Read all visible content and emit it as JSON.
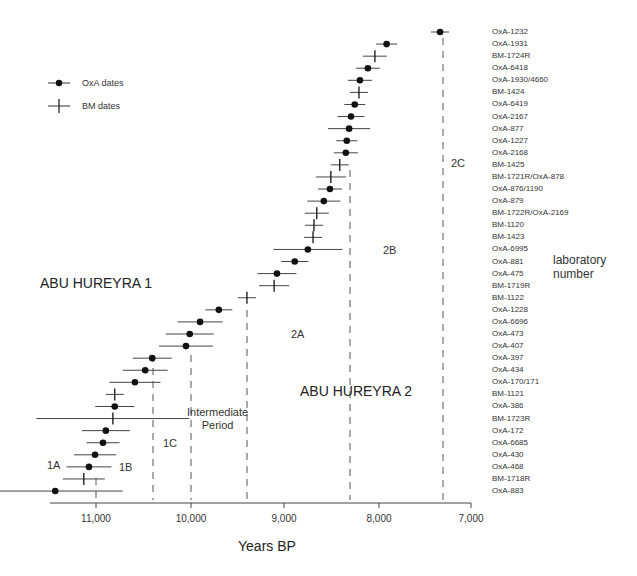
{
  "chart_data": {
    "type": "scatter",
    "title": "",
    "xlabel": "Years BP",
    "ylabel": "laboratory number",
    "x_reversed": true,
    "xlim": [
      11600,
      7000
    ],
    "xticks": [
      11000,
      10000,
      9000,
      8000,
      7000
    ],
    "xtick_labels": [
      "11,000",
      "10,000",
      "9,000",
      "8,000",
      "7,000"
    ],
    "grid": false,
    "legend": {
      "position": "upper-left",
      "entries": [
        {
          "label": "OxA dates",
          "marker": "dot-with-errorbar"
        },
        {
          "label": "BM dates",
          "marker": "cross-with-errorbar"
        }
      ]
    },
    "series": [
      {
        "lab": "OxA-1232",
        "type": "OxA",
        "bp": 7330,
        "err": 60
      },
      {
        "lab": "OxA-1931",
        "type": "OxA",
        "bp": 7900,
        "err": 70
      },
      {
        "lab": "BM-1724R",
        "type": "BM",
        "bp": 8025,
        "err": 80
      },
      {
        "lab": "OxA-6418",
        "type": "OxA",
        "bp": 8100,
        "err": 80
      },
      {
        "lab": "OxA-1930/4660",
        "type": "OxA",
        "bp": 8185,
        "err": 80
      },
      {
        "lab": "BM-1424",
        "type": "BM",
        "bp": 8195,
        "err": 60
      },
      {
        "lab": "OxA-6419",
        "type": "OxA",
        "bp": 8240,
        "err": 70
      },
      {
        "lab": "OxA-2167",
        "type": "OxA",
        "bp": 8280,
        "err": 90
      },
      {
        "lab": "OxA-877",
        "type": "OxA",
        "bp": 8300,
        "err": 140
      },
      {
        "lab": "OxA-1227",
        "type": "OxA",
        "bp": 8325,
        "err": 70
      },
      {
        "lab": "OxA-2168",
        "type": "OxA",
        "bp": 8335,
        "err": 80
      },
      {
        "lab": "BM-1425",
        "type": "BM",
        "bp": 8400,
        "err": 60
      },
      {
        "lab": "BM-1721R/OxA-878",
        "type": "BM",
        "bp": 8495,
        "err": 100
      },
      {
        "lab": "OxA-876/1190",
        "type": "OxA",
        "bp": 8505,
        "err": 80
      },
      {
        "lab": "OxA-879",
        "type": "OxA",
        "bp": 8570,
        "err": 110
      },
      {
        "lab": "BM-1722R/OxA-2169",
        "type": "BM",
        "bp": 8645,
        "err": 80
      },
      {
        "lab": "BM-1120",
        "type": "BM",
        "bp": 8675,
        "err": 60
      },
      {
        "lab": "BM-1423",
        "type": "BM",
        "bp": 8685,
        "err": 60
      },
      {
        "lab": "OxA-6995",
        "type": "OxA",
        "bp": 8740,
        "err": 230
      },
      {
        "lab": "OxA-881",
        "type": "OxA",
        "bp": 8880,
        "err": 90
      },
      {
        "lab": "OxA-475",
        "type": "OxA",
        "bp": 9070,
        "err": 130
      },
      {
        "lab": "BM-1719R",
        "type": "BM",
        "bp": 9100,
        "err": 100
      },
      {
        "lab": "BM-1122",
        "type": "BM",
        "bp": 9390,
        "err": 60
      },
      {
        "lab": "OxA-1228",
        "type": "OxA",
        "bp": 9690,
        "err": 90
      },
      {
        "lab": "OxA-6696",
        "type": "OxA",
        "bp": 9890,
        "err": 150
      },
      {
        "lab": "OxA-473",
        "type": "OxA",
        "bp": 10000,
        "err": 160
      },
      {
        "lab": "OxA-407",
        "type": "OxA",
        "bp": 10040,
        "err": 180
      },
      {
        "lab": "OxA-397",
        "type": "OxA",
        "bp": 10400,
        "err": 130
      },
      {
        "lab": "OxA-434",
        "type": "OxA",
        "bp": 10475,
        "err": 150
      },
      {
        "lab": "OxA-170/171",
        "type": "OxA",
        "bp": 10585,
        "err": 170
      },
      {
        "lab": "BM-1121",
        "type": "BM",
        "bp": 10800,
        "err": 60
      },
      {
        "lab": "OxA-386",
        "type": "OxA",
        "bp": 10800,
        "err": 130
      },
      {
        "lab": "BM-1723R",
        "type": "BM",
        "bp": 10820,
        "err": 510
      },
      {
        "lab": "OxA-172",
        "type": "OxA",
        "bp": 10895,
        "err": 160
      },
      {
        "lab": "OxA-6685",
        "type": "OxA",
        "bp": 10925,
        "err": 110
      },
      {
        "lab": "OxA-430",
        "type": "OxA",
        "bp": 11010,
        "err": 140
      },
      {
        "lab": "OxA-468",
        "type": "OxA",
        "bp": 11075,
        "err": 150
      },
      {
        "lab": "BM-1718R",
        "type": "BM",
        "bp": 11130,
        "err": 140
      },
      {
        "lab": "OxA-883",
        "type": "OxA",
        "bp": 11435,
        "err": 450
      }
    ],
    "period_boundaries_bp": [
      11000,
      10400,
      10000,
      9400,
      8300,
      7300
    ],
    "annotations": [
      {
        "text": "ABU HUREYRA 1"
      },
      {
        "text": "ABU HUREYRA 2"
      },
      {
        "text": "1A"
      },
      {
        "text": "1B"
      },
      {
        "text": "1C"
      },
      {
        "text": "Intermediate Period"
      },
      {
        "text": "2A"
      },
      {
        "text": "2B"
      },
      {
        "text": "2C"
      }
    ]
  },
  "labels": {
    "xlabel": "Years BP",
    "ylabel_line1": "laboratory",
    "ylabel_line2": "number",
    "legend_oxa": "OxA dates",
    "legend_bm": "BM dates",
    "ah1": "ABU HUREYRA 1",
    "ah2": "ABU HUREYRA 2",
    "p1a": "1A",
    "p1b": "1B",
    "p1c": "1C",
    "inter1": "Intermediate",
    "inter2": "Period",
    "p2a": "2A",
    "p2b": "2B",
    "p2c": "2C",
    "t11000": "11,000",
    "t10000": "10,000",
    "t9000": "9,000",
    "t8000": "8,000",
    "t7000": "7,000"
  },
  "colors": {
    "ink": "#111111",
    "line": "#444444",
    "dash": "#555555"
  }
}
